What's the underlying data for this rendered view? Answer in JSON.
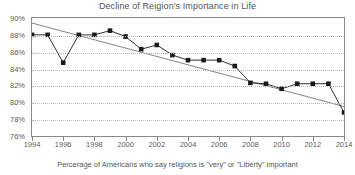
{
  "chart_data": {
    "type": "line",
    "title": "Decline of Reigion's Importance in Life",
    "subtitle": "Percerage of Americans who say religions is \"very\" or \"Liberty\" important",
    "xlabel": "",
    "ylabel": "",
    "xlim": [
      1994,
      2014
    ],
    "ylim": [
      76,
      90
    ],
    "ytick_step": 2,
    "xtick_step": 2,
    "grid": true,
    "legend": false,
    "marker": "filled-square",
    "line_color": "#1a1a1a",
    "marker_color": "#1a1a1a",
    "trendline": {
      "type": "linear",
      "color": "#777777",
      "start": {
        "x": 1994,
        "y": 89.4
      },
      "end": {
        "x": 2014,
        "y": 79.5
      }
    },
    "x": [
      1994,
      1995,
      1996,
      1997,
      1998,
      1999,
      2000,
      2001,
      2002,
      2003,
      2004,
      2005,
      2006,
      2007,
      2008,
      2009,
      2010,
      2011,
      2012,
      2013,
      2014
    ],
    "values": [
      88.0,
      88.0,
      84.7,
      88.0,
      88.0,
      88.5,
      87.8,
      86.3,
      86.8,
      85.6,
      85.0,
      85.0,
      85.0,
      84.3,
      82.3,
      82.2,
      81.6,
      82.2,
      82.2,
      82.2,
      78.8
    ],
    "series": [
      {
        "name": "Percentage of Americans",
        "values": [
          88.0,
          88.0,
          84.7,
          88.0,
          88.0,
          88.5,
          87.8,
          86.3,
          86.8,
          85.6,
          85.0,
          85.0,
          85.0,
          84.3,
          82.3,
          82.2,
          81.6,
          82.2,
          82.2,
          82.2,
          78.8
        ]
      }
    ],
    "ytick_labels": [
      "90%",
      "88%",
      "86%",
      "84%",
      "82%",
      "80%",
      "78%",
      "76%"
    ],
    "ytick_values": [
      90,
      88,
      86,
      84,
      82,
      80,
      78,
      76
    ],
    "xtick_labels": [
      "1994",
      "1996",
      "1998",
      "2000",
      "2002",
      "2004",
      "2006",
      "2008",
      "2010",
      "2012",
      "2014"
    ],
    "xtick_values": [
      1994,
      1996,
      1998,
      2000,
      2002,
      2004,
      2006,
      2008,
      2010,
      2012,
      2014
    ]
  }
}
